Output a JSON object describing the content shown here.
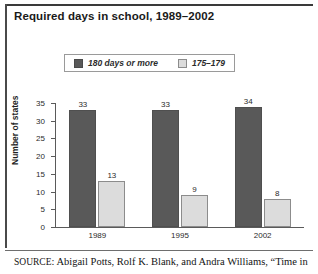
{
  "title": "Required days in school, 1989–2002",
  "source": {
    "prefix": "SOURCE",
    "separator": ": ",
    "text": "Abigail Potts, Rolf K. Blank, and Andra Williams, “Time in"
  },
  "colors": {
    "series_dark": "#595959",
    "series_light": "#dcdcdc",
    "axis": "#5a5a5a",
    "text": "#2b2b2b"
  },
  "chart_data": {
    "type": "bar",
    "title": "Required days in school, 1989–2002",
    "xlabel": "",
    "ylabel": "Number of states",
    "categories": [
      "1989",
      "1995",
      "2002"
    ],
    "series": [
      {
        "name": "180 days or more",
        "values": [
          33,
          33,
          34
        ],
        "color": "#595959"
      },
      {
        "name": "175–179",
        "values": [
          13,
          9,
          8
        ],
        "color": "#dcdcdc"
      }
    ],
    "ylim": [
      0,
      35
    ],
    "yticks": [
      0,
      5,
      10,
      15,
      20,
      25,
      30,
      35
    ],
    "ytick_labels": [
      "0",
      "5",
      "10",
      "15",
      "20",
      "25",
      "30",
      "35"
    ],
    "grid": false,
    "legend_position": "top-center",
    "data_labels": true
  }
}
